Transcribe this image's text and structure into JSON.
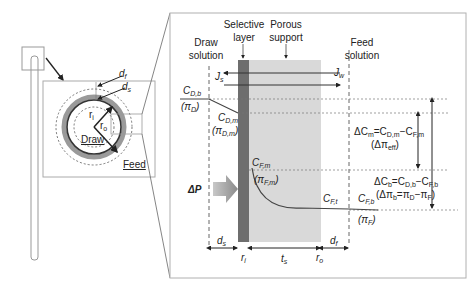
{
  "figure": {
    "overview": {
      "labels": {
        "d_f": "d",
        "d_f_sub": "f",
        "d_s": "d",
        "d_s_sub": "s",
        "r_i": "r",
        "r_i_sub": "i",
        "r_o": "r",
        "r_o_sub": "o",
        "draw": "Draw",
        "feed": "Feed"
      }
    },
    "detail": {
      "regions": {
        "draw_solution_line1": "Draw",
        "draw_solution_line2": "solution",
        "selective_layer_line1": "Selective",
        "selective_layer_line2": "layer",
        "porous_support_line1": "Porous",
        "porous_support_line2": "support",
        "feed_solution_line1": "Feed",
        "feed_solution_line2": "solution"
      },
      "fluxes": {
        "Js": "J",
        "Js_sub": "s",
        "Jw": "J",
        "Jw_sub": "w"
      },
      "concentrations": {
        "CDb": "C",
        "CDb_sub": "D,b",
        "piD": "(π",
        "piD_sub": "D",
        "CDm": "C",
        "CDm_sub": "D,m",
        "piDm": "(π",
        "piDm_sub": "D,m",
        "CFm": "C",
        "CFm_sub": "F,m",
        "piFm": "(π",
        "piFm_sub": "F,m",
        "CFt": "C",
        "CFt_sub": "F,t",
        "CFb": "C",
        "CFb_sub": "F,b",
        "piF": "(π",
        "piF_sub": "F",
        "close": ")"
      },
      "driving_forces": {
        "deltaCm": "ΔC",
        "deltaCm_sub": "m",
        "deltaCm_eq": "=C",
        "deltaCm_eq_sub1": "D,m",
        "deltaCm_eq_mid": "−C",
        "deltaCm_eq_sub2": "F,m",
        "deltaPiEff": "(Δπ",
        "deltaPiEff_sub": "eff",
        "deltaCb": "ΔC",
        "deltaCb_sub": "b",
        "deltaCb_eq": "=C",
        "deltaCb_eq_sub1": "D,b",
        "deltaCb_eq_mid": "−C",
        "deltaCb_eq_sub2": "F,b",
        "deltaPib": "(Δπ",
        "deltaPib_sub": "b",
        "deltaPib_eq": "=π",
        "deltaPib_eq_sub1": "D",
        "deltaPib_eq_mid": "−π",
        "deltaPib_eq_sub2": "F",
        "deltaP": "ΔP"
      },
      "dimensions": {
        "ds": "d",
        "ds_sub": "s",
        "ri": "r",
        "ri_sub": "i",
        "ts": "t",
        "ts_sub": "s",
        "ro": "r",
        "ro_sub": "o",
        "df": "d",
        "df_sub": "f"
      },
      "colors": {
        "selective_layer": "#6e6e6e",
        "porous_support": "#d9d9d9",
        "delta_p_arrow": "#9a9a9a",
        "frame": "#b0b0b0"
      }
    }
  }
}
